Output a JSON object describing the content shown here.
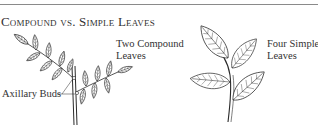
{
  "title": "Compound vs. Simple Leaves",
  "labels": {
    "compound_line1": "Two Compound",
    "compound_line2": "Leaves",
    "simple_line1": "Four Simple",
    "simple_line2": "Leaves",
    "buds": "Axillary Buds"
  },
  "illustrations": [
    {
      "name": "compound-leaves-branch",
      "leaf_type": "compound",
      "count": 2
    },
    {
      "name": "simple-leaves-branch",
      "leaf_type": "simple",
      "count": 4
    }
  ],
  "colors": {
    "line": "#2a2a2a",
    "rule": "#8a8a8a",
    "background": "#ffffff"
  }
}
